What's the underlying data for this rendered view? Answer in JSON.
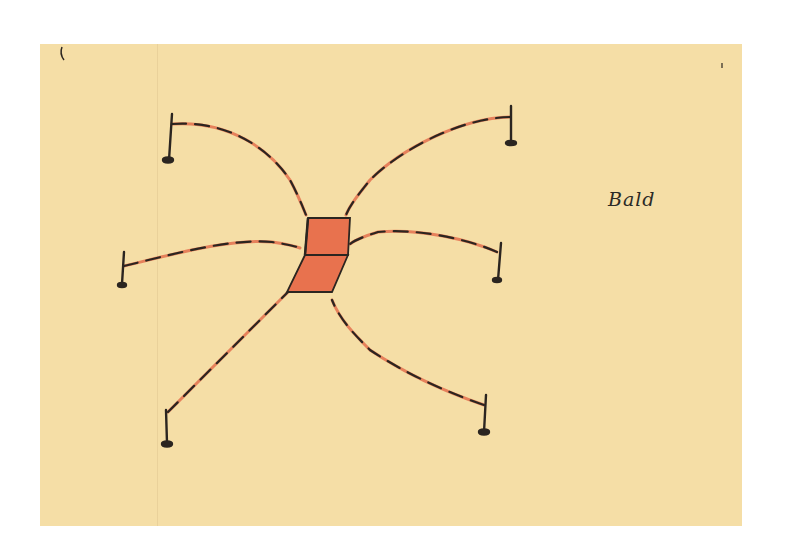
{
  "sketch": {
    "label": "Bald",
    "colors": {
      "paper": "#f5dea6",
      "ink": "#2b2520",
      "accent_red": "#e4714f",
      "block_fill": "#e8724e"
    },
    "elements": {
      "center_block": "chair-like red block",
      "poles": [
        "top-left",
        "top-right",
        "middle-left",
        "middle-right",
        "bottom-left",
        "bottom-right"
      ]
    }
  }
}
